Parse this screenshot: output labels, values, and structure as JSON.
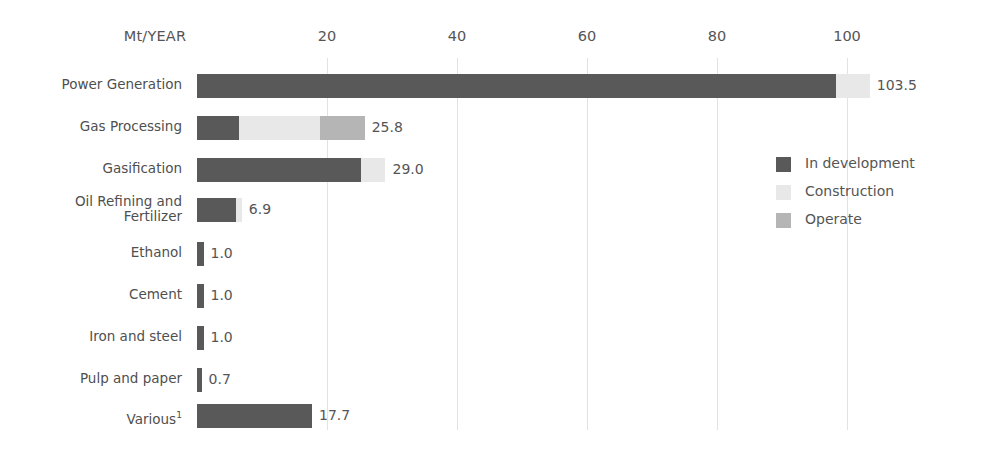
{
  "chart_data": {
    "type": "bar",
    "orientation": "horizontal",
    "stacked": true,
    "title": "",
    "xlabel": "Mt/YEAR",
    "ylabel": "",
    "xlim": [
      0,
      110
    ],
    "grid": true,
    "grid_axis": "x",
    "legend_position": "right-middle",
    "tick_labels": [
      "20",
      "40",
      "60",
      "80",
      "100"
    ],
    "tick_values": [
      20,
      40,
      60,
      80,
      100
    ],
    "categories": [
      "Power Generation",
      "Gas Processing",
      "Gasification",
      "Oil Refining and Fertilizer",
      "Ethanol",
      "Cement",
      "Iron and steel",
      "Pulp and paper",
      "Various"
    ],
    "series": [
      {
        "name": "In development",
        "color": "#595959",
        "values": [
          98.3,
          6.4,
          25.2,
          6.0,
          1.0,
          1.0,
          1.0,
          0.7,
          17.7
        ]
      },
      {
        "name": "Construction",
        "color": "#e8e8e8",
        "values": [
          5.2,
          12.6,
          3.8,
          0.9,
          0.0,
          0.0,
          0.0,
          0.0,
          0.0
        ]
      },
      {
        "name": "Operate",
        "color": "#b5b5b5",
        "values": [
          0.0,
          6.8,
          0.0,
          0.0,
          0.0,
          0.0,
          0.0,
          0.0,
          0.0
        ]
      }
    ],
    "totals": [
      103.5,
      25.8,
      29.0,
      6.9,
      1.0,
      1.0,
      1.0,
      0.7,
      17.7
    ],
    "value_labels": [
      "103.5",
      "25.8",
      "29.0",
      "6.9",
      "1.0",
      "1.0",
      "1.0",
      "0.7",
      "17.7"
    ],
    "footnote_marker": "1",
    "footnote_category": "Various"
  },
  "axis": {
    "title": "Mt/YEAR"
  },
  "rows": [
    {
      "label": "Power Generation",
      "value_label": "103.5",
      "line1": "Power Generation",
      "line2": ""
    },
    {
      "label": "Gas Processing",
      "value_label": "25.8",
      "line1": "Gas Processing",
      "line2": ""
    },
    {
      "label": "Gasification",
      "value_label": "29.0",
      "line1": "Gasification",
      "line2": ""
    },
    {
      "label": "Oil Refining and Fertilizer",
      "value_label": "6.9",
      "line1": "Oil Refining and",
      "line2": "Fertilizer"
    },
    {
      "label": "Ethanol",
      "value_label": "1.0",
      "line1": "Ethanol",
      "line2": ""
    },
    {
      "label": "Cement",
      "value_label": "1.0",
      "line1": "Cement",
      "line2": ""
    },
    {
      "label": "Iron and steel",
      "value_label": "1.0",
      "line1": "Iron and steel",
      "line2": ""
    },
    {
      "label": "Pulp and paper",
      "value_label": "0.7",
      "line1": "Pulp and paper",
      "line2": ""
    },
    {
      "label": "Various",
      "value_label": "17.7",
      "line1": "Various",
      "line2": "",
      "superscript": "1"
    }
  ],
  "legend": {
    "items": [
      {
        "label": "In development",
        "color": "#595959"
      },
      {
        "label": "Construction",
        "color": "#e8e8e8"
      },
      {
        "label": "Operate",
        "color": "#b5b5b5"
      }
    ]
  },
  "ticks": [
    {
      "label": "20"
    },
    {
      "label": "40"
    },
    {
      "label": "60"
    },
    {
      "label": "80"
    },
    {
      "label": "100"
    }
  ]
}
